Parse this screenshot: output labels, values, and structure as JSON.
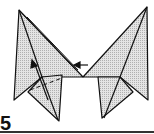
{
  "diagram": {
    "step_number": "5",
    "colors": {
      "paper_fill": "#d0d0d0",
      "line": "#111111",
      "background": "#ffffff"
    },
    "annotations": [
      {
        "type": "arrow",
        "direction": "left",
        "label": "fold-in-arrow"
      },
      {
        "type": "arrow",
        "direction": "up",
        "label": "lift-arrow"
      },
      {
        "type": "dashed-line",
        "label": "fold-line"
      }
    ]
  }
}
